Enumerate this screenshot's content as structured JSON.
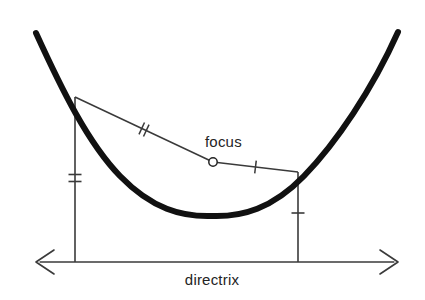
{
  "figure": {
    "background_color": "#ffffff",
    "width": 425,
    "height": 300
  },
  "labels": {
    "focus": "focus",
    "directrix": "directrix"
  },
  "colors": {
    "curve": "#111111",
    "line": "#3a3a3a",
    "tick": "#3a3a3a",
    "text": "#242424",
    "marker_fill": "#ffffff"
  },
  "geometry": {
    "parabola": {
      "vertex": [
        212,
        215
      ],
      "left_end": [
        36,
        33
      ],
      "right_end": [
        398,
        32
      ],
      "stroke_width": 6,
      "path": "M 36 33 Q 74 122 120 176 Q 166 228 212 215 Q 258 228 304 176 Q 350 122 398 32"
    },
    "directrix": {
      "y": 262,
      "x_start": 36,
      "x_end": 398,
      "stroke_width": 1.6,
      "arrow_left": true,
      "arrow_right": true
    },
    "focus_point": {
      "cx": 213,
      "cy": 162,
      "r": 4.2,
      "stroke_width": 1.5
    },
    "point_left": [
      75,
      97
    ],
    "point_right": [
      298,
      172
    ],
    "dropline_left": {
      "x": 75,
      "y_top": 97,
      "y_bottom": 262,
      "ticks": 2,
      "tick_y": 178
    },
    "dropline_right": {
      "x": 298,
      "y_top": 172,
      "y_bottom": 262,
      "ticks": 1,
      "tick_y": 213
    },
    "segment_left_to_focus": {
      "x1": 75,
      "y1": 97,
      "x2": 213,
      "y2": 162,
      "ticks": 2,
      "tick_t": 0.5
    },
    "segment_focus_to_right": {
      "x1": 213,
      "y1": 162,
      "x2": 298,
      "y2": 172,
      "ticks": 1,
      "tick_t": 0.5
    }
  },
  "annotations": {
    "focus_label_pos": [
      205,
      147
    ],
    "directrix_label_pos": [
      212,
      285
    ],
    "tick_length": 13,
    "tick_gap": 5
  }
}
